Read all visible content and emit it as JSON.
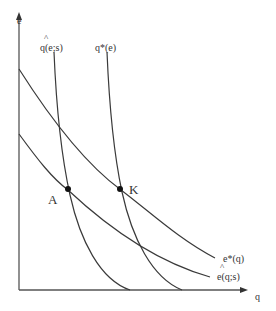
{
  "diagram": {
    "axes": {
      "y_label": "e",
      "x_label": "q"
    },
    "curves": {
      "q_hat": {
        "label": "q(e;s)",
        "hat": "^"
      },
      "q_star": {
        "label": "q*(e)"
      },
      "e_star": {
        "label": "e*(q)"
      },
      "e_hat": {
        "label": "e(q;s)",
        "hat": "^"
      }
    },
    "points": {
      "A": {
        "label": "A"
      },
      "K": {
        "label": "K"
      }
    },
    "colors": {
      "line": "#3a3a3a",
      "background": "#ffffff"
    }
  }
}
